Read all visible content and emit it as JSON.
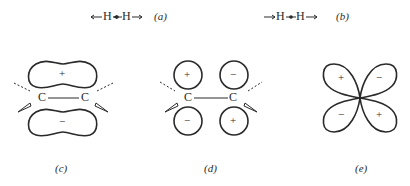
{
  "panels": {
    "a": {
      "label": "a",
      "left_arrow": "←",
      "atom1": "H",
      "dot_arrow": "◂•",
      "atom2": "H",
      "right_arrow": "→"
    },
    "b": {
      "label": "b",
      "left_arrow": "→",
      "atom1": "H",
      "dot_arrow": "•",
      "atom2": "H",
      "right_arrow": "→"
    },
    "c": {
      "label": "c",
      "atom_left": "C",
      "atom_right": "C",
      "lobe_top_sign": "+",
      "lobe_bottom_sign": "−"
    },
    "d": {
      "label": "d",
      "atom_left": "C",
      "atom_right": "C",
      "top_left_sign": "+",
      "top_right_sign": "−",
      "bottom_left_sign": "−",
      "bottom_right_sign": "+"
    },
    "e": {
      "label": "e",
      "top_left_sign": "+",
      "top_right_sign": "−",
      "bottom_left_sign": "−",
      "bottom_right_sign": "+"
    }
  },
  "colors": {
    "ink": "#2a2a2a",
    "background": "#ffffff"
  }
}
